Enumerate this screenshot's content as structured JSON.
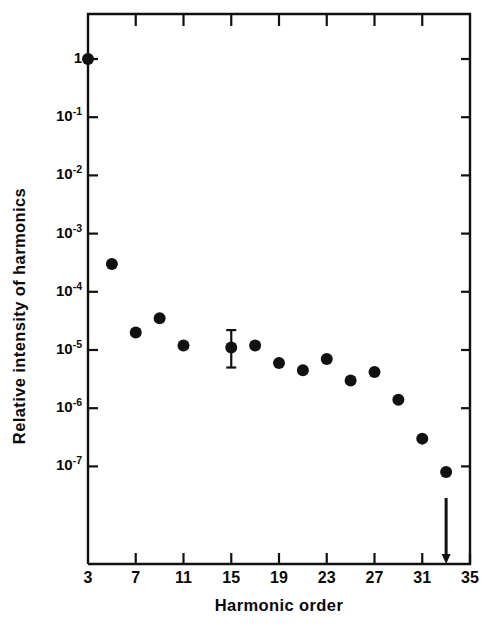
{
  "chart_data": {
    "type": "scatter",
    "title": "",
    "xlabel": "Harmonic order",
    "ylabel": "Relative intensity of harmonics",
    "yscale": "log",
    "xlim": [
      3,
      35
    ],
    "ylim": [
      1e-08,
      3
    ],
    "grid": false,
    "legend": null,
    "x_tick_labels": [
      "3",
      "7",
      "11",
      "15",
      "19",
      "23",
      "27",
      "31",
      "35"
    ],
    "x_ticks": [
      3,
      7,
      11,
      15,
      19,
      23,
      27,
      31,
      35
    ],
    "x_minor_ticks": [
      5,
      9,
      13,
      17,
      21,
      25,
      29,
      33
    ],
    "y_ticks": [
      1,
      0.1,
      0.01,
      0.001,
      0.0001,
      1e-05,
      1e-06,
      1e-07
    ],
    "y_tick_labels": [
      {
        "mantissa": "1",
        "exponent": ""
      },
      {
        "mantissa": "10",
        "exponent": "-1"
      },
      {
        "mantissa": "10",
        "exponent": "-2"
      },
      {
        "mantissa": "10",
        "exponent": "-3"
      },
      {
        "mantissa": "10",
        "exponent": "-4"
      },
      {
        "mantissa": "10",
        "exponent": "-5"
      },
      {
        "mantissa": "10",
        "exponent": "-6"
      },
      {
        "mantissa": "10",
        "exponent": "-7"
      }
    ],
    "marker": "filled-circle",
    "marker_color": "#111111",
    "points": [
      {
        "x": 3,
        "y": 1.0
      },
      {
        "x": 5,
        "y": 0.0003
      },
      {
        "x": 7,
        "y": 2e-05
      },
      {
        "x": 9,
        "y": 3.5e-05
      },
      {
        "x": 11,
        "y": 1.2e-05
      },
      {
        "x": 15,
        "y": 1.1e-05,
        "yerr_low": 5e-06,
        "yerr_high": 2.2e-05
      },
      {
        "x": 17,
        "y": 1.2e-05
      },
      {
        "x": 19,
        "y": 6e-06
      },
      {
        "x": 21,
        "y": 4.5e-06
      },
      {
        "x": 23,
        "y": 7e-06
      },
      {
        "x": 25,
        "y": 3e-06
      },
      {
        "x": 27,
        "y": 4.2e-06
      },
      {
        "x": 29,
        "y": 1.4e-06
      },
      {
        "x": 31,
        "y": 3e-07
      },
      {
        "x": 33,
        "y": 8e-08,
        "upper_limit_arrow": true
      }
    ],
    "annotations": [
      {
        "kind": "down-arrow",
        "x": 33,
        "note": "upper-limit arrow below harmonic 33 point"
      }
    ],
    "axis_color": "#111111",
    "background": "#ffffff"
  }
}
